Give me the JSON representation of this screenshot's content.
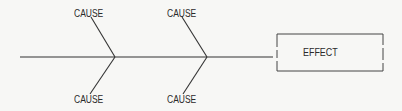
{
  "diagram": {
    "type": "fishbone",
    "colors": {
      "line": "#333333",
      "text": "#2a2a2a",
      "background": "#f7f7f5"
    },
    "causes": [
      {
        "id": "cause-top-1",
        "label": "CAUSE",
        "position": "top",
        "joint": 1
      },
      {
        "id": "cause-bottom-1",
        "label": "CAUSE",
        "position": "bottom",
        "joint": 1
      },
      {
        "id": "cause-top-2",
        "label": "CAUSE",
        "position": "top",
        "joint": 2
      },
      {
        "id": "cause-bottom-2",
        "label": "CAUSE",
        "position": "bottom",
        "joint": 2
      }
    ],
    "effect": {
      "label": "EFFECT"
    }
  }
}
